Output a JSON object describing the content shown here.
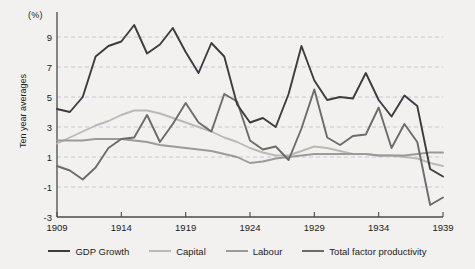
{
  "chart_data": {
    "type": "line",
    "title": "",
    "subtitle": "",
    "xlabel": "",
    "ylabel": "Ten year averages",
    "unit_label": "(%)",
    "grid": true,
    "grid_orientation": "horizontal",
    "legend_position": "bottom",
    "xlim": [
      1909,
      1939
    ],
    "ylim": [
      -3,
      10.4
    ],
    "x_ticks": [
      1909,
      1914,
      1919,
      1924,
      1929,
      1934,
      1939
    ],
    "y_ticks": [
      9,
      7,
      5,
      3,
      1,
      -1,
      -3
    ],
    "x_tick_labels": [
      "1909",
      "1914",
      "1919",
      "1924",
      "1929",
      "1934",
      "1939"
    ],
    "y_tick_labels": [
      "9",
      "7",
      "5",
      "3",
      "1",
      "-1",
      "-3"
    ],
    "x": [
      1909,
      1910,
      1911,
      1912,
      1913,
      1914,
      1915,
      1916,
      1917,
      1918,
      1919,
      1920,
      1921,
      1922,
      1923,
      1924,
      1925,
      1926,
      1927,
      1928,
      1929,
      1930,
      1931,
      1932,
      1933,
      1934,
      1935,
      1936,
      1937,
      1938,
      1939
    ],
    "series": [
      {
        "name": "GDP Growth",
        "color": "#3c3c3c",
        "values": [
          4.2,
          4.0,
          5.0,
          7.7,
          8.4,
          8.7,
          9.8,
          7.9,
          8.5,
          9.6,
          8.0,
          6.6,
          8.6,
          7.7,
          4.5,
          3.3,
          3.6,
          3.0,
          5.2,
          8.4,
          6.1,
          4.8,
          5.0,
          4.9,
          6.6,
          4.8,
          3.7,
          5.1,
          4.4,
          0.2,
          -0.3
        ]
      },
      {
        "name": "Capital",
        "color": "#b9b9b9",
        "values": [
          1.9,
          2.3,
          2.7,
          3.1,
          3.4,
          3.8,
          4.1,
          4.1,
          3.9,
          3.6,
          3.3,
          3.0,
          2.7,
          2.3,
          2.0,
          1.6,
          1.3,
          1.1,
          1.1,
          1.4,
          1.7,
          1.6,
          1.4,
          1.2,
          1.2,
          1.1,
          1.1,
          1.0,
          0.9,
          0.6,
          0.4
        ]
      },
      {
        "name": "Labour",
        "color": "#9a9a9a",
        "values": [
          2.1,
          2.1,
          2.1,
          2.2,
          2.2,
          2.2,
          2.1,
          2.0,
          1.8,
          1.7,
          1.6,
          1.5,
          1.4,
          1.2,
          1.0,
          0.6,
          0.7,
          0.9,
          1.0,
          1.1,
          1.2,
          1.2,
          1.2,
          1.2,
          1.2,
          1.1,
          1.1,
          1.1,
          1.2,
          1.3,
          1.3
        ]
      },
      {
        "name": "Total factor productivity",
        "color": "#6b6b6b",
        "values": [
          0.4,
          0.1,
          -0.5,
          0.3,
          1.6,
          2.2,
          2.3,
          3.8,
          2.0,
          3.2,
          4.6,
          3.3,
          2.7,
          5.2,
          4.7,
          2.1,
          1.5,
          1.7,
          0.8,
          2.9,
          5.5,
          2.3,
          1.8,
          2.4,
          2.5,
          4.3,
          1.6,
          3.2,
          2.0,
          -2.2,
          -1.7
        ]
      }
    ]
  },
  "legend": {
    "items": [
      {
        "label": "GDP Growth",
        "color": "#3c3c3c"
      },
      {
        "label": "Capital",
        "color": "#b9b9b9"
      },
      {
        "label": "Labour",
        "color": "#9a9a9a"
      },
      {
        "label": "Total factor productivity",
        "color": "#6b6b6b"
      }
    ]
  },
  "axes": {
    "unit_label": "(%)",
    "y_title": "Ten year averages"
  },
  "style": {
    "background": "#f2f1ef",
    "axis_color": "#4a4a4a",
    "grid_color": "#b9bfcf",
    "text_color": "#1b1b1b"
  }
}
